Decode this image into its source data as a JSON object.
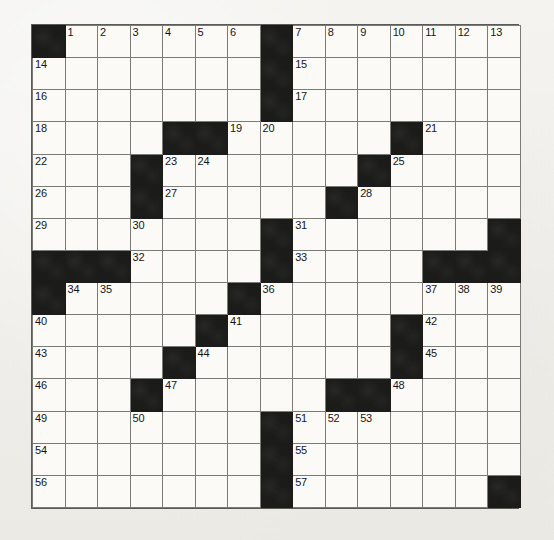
{
  "puzzle": {
    "kind": "crossword-grid",
    "rows": 17,
    "cols": 15,
    "colors": {
      "block": "#1b1b1a",
      "cell": "#fbfaf7",
      "gridline": "#7b7b76",
      "border": "#5a5a56",
      "page": "#f2f1ee",
      "number_text": "#16161a"
    },
    "grid": [
      [
        {
          "block": true,
          "num": ""
        },
        {
          "block": false,
          "num": "1"
        },
        {
          "block": false,
          "num": "2"
        },
        {
          "block": false,
          "num": "3"
        },
        {
          "block": false,
          "num": "4"
        },
        {
          "block": false,
          "num": "5"
        },
        {
          "block": false,
          "num": "6"
        },
        {
          "block": true,
          "num": ""
        },
        {
          "block": false,
          "num": "7"
        },
        {
          "block": false,
          "num": "8"
        },
        {
          "block": false,
          "num": "9"
        },
        {
          "block": false,
          "num": "10"
        },
        {
          "block": false,
          "num": "11"
        },
        {
          "block": false,
          "num": "12"
        },
        {
          "block": false,
          "num": "13"
        }
      ],
      [
        {
          "block": false,
          "num": "14"
        },
        {
          "block": false,
          "num": ""
        },
        {
          "block": false,
          "num": ""
        },
        {
          "block": false,
          "num": ""
        },
        {
          "block": false,
          "num": ""
        },
        {
          "block": false,
          "num": ""
        },
        {
          "block": false,
          "num": ""
        },
        {
          "block": true,
          "num": ""
        },
        {
          "block": false,
          "num": "15"
        },
        {
          "block": false,
          "num": ""
        },
        {
          "block": false,
          "num": ""
        },
        {
          "block": false,
          "num": ""
        },
        {
          "block": false,
          "num": ""
        },
        {
          "block": false,
          "num": ""
        },
        {
          "block": false,
          "num": ""
        }
      ],
      [
        {
          "block": false,
          "num": "16"
        },
        {
          "block": false,
          "num": ""
        },
        {
          "block": false,
          "num": ""
        },
        {
          "block": false,
          "num": ""
        },
        {
          "block": false,
          "num": ""
        },
        {
          "block": false,
          "num": ""
        },
        {
          "block": false,
          "num": ""
        },
        {
          "block": true,
          "num": ""
        },
        {
          "block": false,
          "num": "17"
        },
        {
          "block": false,
          "num": ""
        },
        {
          "block": false,
          "num": ""
        },
        {
          "block": false,
          "num": ""
        },
        {
          "block": false,
          "num": ""
        },
        {
          "block": false,
          "num": ""
        },
        {
          "block": false,
          "num": ""
        }
      ],
      [
        {
          "block": false,
          "num": "18"
        },
        {
          "block": false,
          "num": ""
        },
        {
          "block": false,
          "num": ""
        },
        {
          "block": false,
          "num": ""
        },
        {
          "block": true,
          "num": ""
        },
        {
          "block": true,
          "num": ""
        },
        {
          "block": false,
          "num": "19"
        },
        {
          "block": false,
          "num": "20"
        },
        {
          "block": false,
          "num": ""
        },
        {
          "block": false,
          "num": ""
        },
        {
          "block": false,
          "num": ""
        },
        {
          "block": true,
          "num": ""
        },
        {
          "block": false,
          "num": "21"
        },
        {
          "block": false,
          "num": ""
        },
        {
          "block": false,
          "num": ""
        }
      ],
      [
        {
          "block": false,
          "num": "22"
        },
        {
          "block": false,
          "num": ""
        },
        {
          "block": false,
          "num": ""
        },
        {
          "block": true,
          "num": ""
        },
        {
          "block": false,
          "num": "23"
        },
        {
          "block": false,
          "num": "24"
        },
        {
          "block": false,
          "num": ""
        },
        {
          "block": false,
          "num": ""
        },
        {
          "block": false,
          "num": ""
        },
        {
          "block": false,
          "num": ""
        },
        {
          "block": true,
          "num": ""
        },
        {
          "block": false,
          "num": "25"
        },
        {
          "block": false,
          "num": ""
        },
        {
          "block": false,
          "num": ""
        },
        {
          "block": false,
          "num": ""
        }
      ],
      [
        {
          "block": false,
          "num": "26"
        },
        {
          "block": false,
          "num": ""
        },
        {
          "block": false,
          "num": ""
        },
        {
          "block": true,
          "num": ""
        },
        {
          "block": false,
          "num": "27"
        },
        {
          "block": false,
          "num": ""
        },
        {
          "block": false,
          "num": ""
        },
        {
          "block": false,
          "num": ""
        },
        {
          "block": false,
          "num": ""
        },
        {
          "block": true,
          "num": ""
        },
        {
          "block": false,
          "num": "28"
        },
        {
          "block": false,
          "num": ""
        },
        {
          "block": false,
          "num": ""
        },
        {
          "block": false,
          "num": ""
        },
        {
          "block": false,
          "num": ""
        }
      ],
      [
        {
          "block": false,
          "num": "29"
        },
        {
          "block": false,
          "num": ""
        },
        {
          "block": false,
          "num": ""
        },
        {
          "block": false,
          "num": "30"
        },
        {
          "block": false,
          "num": ""
        },
        {
          "block": false,
          "num": ""
        },
        {
          "block": false,
          "num": ""
        },
        {
          "block": true,
          "num": ""
        },
        {
          "block": false,
          "num": "31"
        },
        {
          "block": false,
          "num": ""
        },
        {
          "block": false,
          "num": ""
        },
        {
          "block": false,
          "num": ""
        },
        {
          "block": false,
          "num": ""
        },
        {
          "block": false,
          "num": ""
        },
        {
          "block": true,
          "num": ""
        }
      ],
      [
        {
          "block": true,
          "num": ""
        },
        {
          "block": true,
          "num": ""
        },
        {
          "block": true,
          "num": ""
        },
        {
          "block": false,
          "num": "32"
        },
        {
          "block": false,
          "num": ""
        },
        {
          "block": false,
          "num": ""
        },
        {
          "block": false,
          "num": ""
        },
        {
          "block": true,
          "num": ""
        },
        {
          "block": false,
          "num": "33"
        },
        {
          "block": false,
          "num": ""
        },
        {
          "block": false,
          "num": ""
        },
        {
          "block": false,
          "num": ""
        },
        {
          "block": true,
          "num": ""
        },
        {
          "block": true,
          "num": ""
        },
        {
          "block": true,
          "num": ""
        }
      ],
      [
        {
          "block": true,
          "num": ""
        },
        {
          "block": false,
          "num": "34"
        },
        {
          "block": false,
          "num": "35"
        },
        {
          "block": false,
          "num": ""
        },
        {
          "block": false,
          "num": ""
        },
        {
          "block": false,
          "num": ""
        },
        {
          "block": true,
          "num": ""
        },
        {
          "block": false,
          "num": "36"
        },
        {
          "block": false,
          "num": ""
        },
        {
          "block": false,
          "num": ""
        },
        {
          "block": false,
          "num": ""
        },
        {
          "block": false,
          "num": ""
        },
        {
          "block": false,
          "num": "37"
        },
        {
          "block": false,
          "num": "38"
        },
        {
          "block": false,
          "num": "39"
        }
      ],
      [
        {
          "block": false,
          "num": "40"
        },
        {
          "block": false,
          "num": ""
        },
        {
          "block": false,
          "num": ""
        },
        {
          "block": false,
          "num": ""
        },
        {
          "block": false,
          "num": ""
        },
        {
          "block": true,
          "num": ""
        },
        {
          "block": false,
          "num": "41"
        },
        {
          "block": false,
          "num": ""
        },
        {
          "block": false,
          "num": ""
        },
        {
          "block": false,
          "num": ""
        },
        {
          "block": false,
          "num": ""
        },
        {
          "block": true,
          "num": ""
        },
        {
          "block": false,
          "num": "42"
        },
        {
          "block": false,
          "num": ""
        },
        {
          "block": false,
          "num": ""
        }
      ],
      [
        {
          "block": false,
          "num": "43"
        },
        {
          "block": false,
          "num": ""
        },
        {
          "block": false,
          "num": ""
        },
        {
          "block": false,
          "num": ""
        },
        {
          "block": true,
          "num": ""
        },
        {
          "block": false,
          "num": "44"
        },
        {
          "block": false,
          "num": ""
        },
        {
          "block": false,
          "num": ""
        },
        {
          "block": false,
          "num": ""
        },
        {
          "block": false,
          "num": ""
        },
        {
          "block": false,
          "num": ""
        },
        {
          "block": true,
          "num": ""
        },
        {
          "block": false,
          "num": "45"
        },
        {
          "block": false,
          "num": ""
        },
        {
          "block": false,
          "num": ""
        }
      ],
      [
        {
          "block": false,
          "num": "46"
        },
        {
          "block": false,
          "num": ""
        },
        {
          "block": false,
          "num": ""
        },
        {
          "block": true,
          "num": ""
        },
        {
          "block": false,
          "num": "47"
        },
        {
          "block": false,
          "num": ""
        },
        {
          "block": false,
          "num": ""
        },
        {
          "block": false,
          "num": ""
        },
        {
          "block": false,
          "num": ""
        },
        {
          "block": true,
          "num": ""
        },
        {
          "block": true,
          "num": ""
        },
        {
          "block": false,
          "num": "48"
        },
        {
          "block": false,
          "num": ""
        },
        {
          "block": false,
          "num": ""
        },
        {
          "block": false,
          "num": ""
        }
      ],
      [
        {
          "block": false,
          "num": "49"
        },
        {
          "block": false,
          "num": ""
        },
        {
          "block": false,
          "num": ""
        },
        {
          "block": false,
          "num": "50"
        },
        {
          "block": false,
          "num": ""
        },
        {
          "block": false,
          "num": ""
        },
        {
          "block": false,
          "num": ""
        },
        {
          "block": true,
          "num": ""
        },
        {
          "block": false,
          "num": "51"
        },
        {
          "block": false,
          "num": "52"
        },
        {
          "block": false,
          "num": "53"
        },
        {
          "block": false,
          "num": ""
        },
        {
          "block": false,
          "num": ""
        },
        {
          "block": false,
          "num": ""
        },
        {
          "block": false,
          "num": ""
        }
      ],
      [
        {
          "block": false,
          "num": "54"
        },
        {
          "block": false,
          "num": ""
        },
        {
          "block": false,
          "num": ""
        },
        {
          "block": false,
          "num": ""
        },
        {
          "block": false,
          "num": ""
        },
        {
          "block": false,
          "num": ""
        },
        {
          "block": false,
          "num": ""
        },
        {
          "block": true,
          "num": ""
        },
        {
          "block": false,
          "num": "55"
        },
        {
          "block": false,
          "num": ""
        },
        {
          "block": false,
          "num": ""
        },
        {
          "block": false,
          "num": ""
        },
        {
          "block": false,
          "num": ""
        },
        {
          "block": false,
          "num": ""
        },
        {
          "block": false,
          "num": ""
        }
      ],
      [
        {
          "block": false,
          "num": "56"
        },
        {
          "block": false,
          "num": ""
        },
        {
          "block": false,
          "num": ""
        },
        {
          "block": false,
          "num": ""
        },
        {
          "block": false,
          "num": ""
        },
        {
          "block": false,
          "num": ""
        },
        {
          "block": false,
          "num": ""
        },
        {
          "block": true,
          "num": ""
        },
        {
          "block": false,
          "num": "57"
        },
        {
          "block": false,
          "num": ""
        },
        {
          "block": false,
          "num": ""
        },
        {
          "block": false,
          "num": ""
        },
        {
          "block": false,
          "num": ""
        },
        {
          "block": false,
          "num": ""
        },
        {
          "block": true,
          "num": ""
        }
      ]
    ]
  }
}
